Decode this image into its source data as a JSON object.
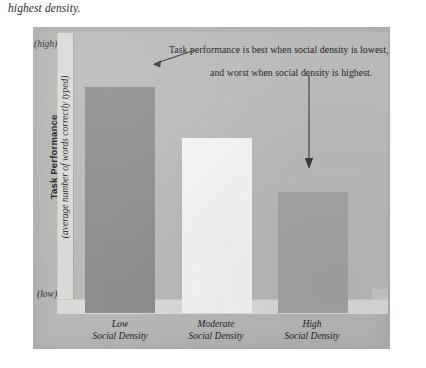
{
  "page": {
    "caption_fragment": "highest density.",
    "clipped_text_ghost": ""
  },
  "chart_data": {
    "type": "bar",
    "title": "",
    "subtitle": "",
    "categories": [
      "Low Social Density",
      "Moderate Social Density",
      "High Social Density"
    ],
    "category_lines": [
      {
        "line1": "Low",
        "line2": "Social Density"
      },
      {
        "line1": "Moderate",
        "line2": "Social Density"
      },
      {
        "line1": "High",
        "line2": "Social Density"
      }
    ],
    "values": [
      80,
      62,
      43
    ],
    "ylim": [
      0,
      100
    ],
    "ylabel": "Task Performance",
    "ylabel_sub": "(average number of words correctly typed)",
    "xlabel": "",
    "y_axis_ticks": [
      "(high)",
      "(low)"
    ],
    "y_axis_high_label": "(high)",
    "y_axis_low_label": "(low)",
    "grid": false,
    "legend": "none",
    "bar_colors": [
      "#8e8e8c",
      "#f3f3f1",
      "#a3a3a1"
    ],
    "annotations": [
      {
        "text": "Task performance is best when social density is lowest,",
        "points_to": "Low Social Density"
      },
      {
        "text": "and worst when social density is highest.",
        "points_to": "High Social Density"
      }
    ]
  },
  "colors": {
    "panel_background": "#b7b7b5",
    "plot_background": "#b9b9b7",
    "axis_wall": "#d9d9d6",
    "text": "#1e1e1e",
    "arrow": "#3a3a3a"
  }
}
